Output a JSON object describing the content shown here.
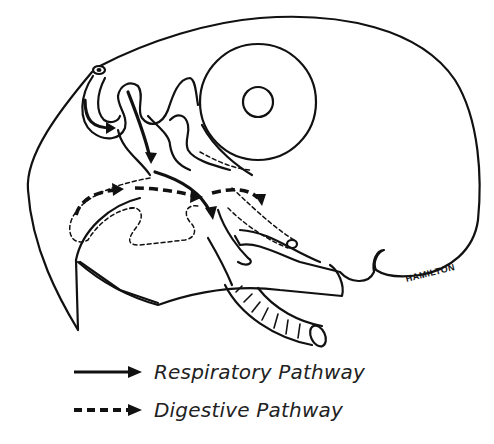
{
  "diagram": {
    "signature": "HAMILTON",
    "parts": [
      "skull-outline",
      "eye",
      "pupil",
      "upper-beak",
      "lower-beak",
      "nostril",
      "nasal-cavity",
      "trachea",
      "esophagus",
      "tongue"
    ]
  },
  "legend": {
    "items": [
      {
        "style": "solid-arrow",
        "label": "Respiratory Pathway"
      },
      {
        "style": "dashed-arrow",
        "label": "Digestive Pathway"
      }
    ]
  },
  "colors": {
    "ink": "#111111",
    "background": "#ffffff",
    "label": "#222222"
  }
}
